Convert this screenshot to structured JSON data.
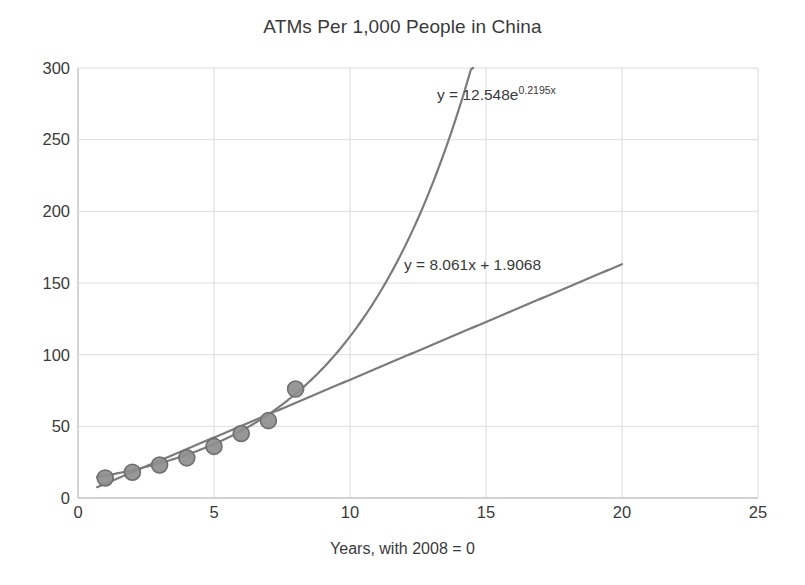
{
  "chart_data": {
    "type": "scatter",
    "title": "ATMs Per 1,000 People in China",
    "xlabel": "Years, with 2008 = 0",
    "ylabel": "",
    "xlim": [
      0,
      25
    ],
    "ylim": [
      0,
      300
    ],
    "xticks": [
      0,
      5,
      10,
      15,
      20,
      25
    ],
    "yticks": [
      0,
      50,
      100,
      150,
      200,
      250,
      300
    ],
    "grid": true,
    "legend": "none",
    "x": [
      1,
      2,
      3,
      4,
      5,
      6,
      7,
      8
    ],
    "values": [
      14,
      18,
      23,
      28,
      36,
      45,
      54,
      76
    ],
    "series": [
      {
        "name": "ATMs per 1,000 people",
        "type": "scatter",
        "x": [
          1,
          2,
          3,
          4,
          5,
          6,
          7,
          8
        ],
        "values": [
          14,
          18,
          23,
          28,
          36,
          45,
          54,
          76
        ],
        "marker_color": "#8e8e8e",
        "marker_edge_color": "#6f6f6f"
      },
      {
        "name": "Exponential trendline",
        "type": "line",
        "equation": "y = 12.548e^0.2195x",
        "coef_a": 12.548,
        "coef_b": 0.2195,
        "color": "#7b7b7b",
        "x_start": 0.7,
        "x_end": 14.6
      },
      {
        "name": "Linear trendline",
        "type": "line",
        "equation": "y = 8.061x + 1.9068",
        "slope": 8.061,
        "intercept": 1.9068,
        "color": "#7b7b7b",
        "x_start": 0.7,
        "x_end": 20.0
      }
    ],
    "annotations": [
      {
        "id": "exponential-equation",
        "base": "y = 12.548e",
        "exponent": "0.2195x",
        "x_px": 437,
        "y_px": 86
      },
      {
        "id": "linear-equation",
        "base": "y = 8.061x + 1.9068",
        "exponent": "",
        "x_px": 404,
        "y_px": 256
      }
    ],
    "colors": {
      "background": "#ffffff",
      "grid": "#dcdcdc",
      "axis": "#c8c8c8",
      "text": "#3a3a3a",
      "trendline": "#7b7b7b",
      "marker": "#8e8e8e"
    }
  },
  "axes": {
    "ytick_labels": [
      "300",
      "250",
      "200",
      "150",
      "100",
      "50",
      "0"
    ],
    "xtick_labels": [
      "0",
      "5",
      "10",
      "15",
      "20",
      "25"
    ]
  }
}
